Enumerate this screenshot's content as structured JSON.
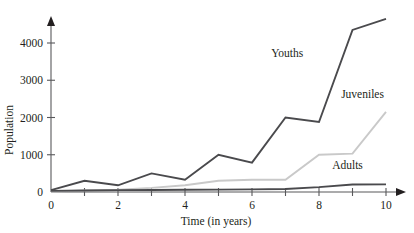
{
  "chart_data": {
    "type": "line",
    "title": "",
    "xlabel": "Time (in years)",
    "ylabel": "Population",
    "xlim": [
      0,
      10
    ],
    "ylim": [
      0,
      4800
    ],
    "grid": false,
    "legend": "inline-annotations",
    "x": [
      0,
      1,
      2,
      3,
      4,
      5,
      6,
      7,
      8,
      9,
      10
    ],
    "xticks": [
      0,
      2,
      4,
      6,
      8,
      10
    ],
    "xtick_labels": [
      "0",
      "2",
      "4",
      "6",
      "8",
      "10"
    ],
    "xminor_ticks": [
      1,
      3,
      5,
      7,
      9
    ],
    "yticks": [
      0,
      1000,
      2000,
      3000,
      4000
    ],
    "ytick_labels": [
      "0",
      "1000",
      "2000",
      "3000",
      "4000"
    ],
    "series": [
      {
        "name": "Youths",
        "color": "#4a4a4d",
        "width": 1.9,
        "values": [
          50,
          300,
          180,
          500,
          330,
          1000,
          790,
          2000,
          1880,
          4350,
          4650
        ],
        "label_x": 7.05,
        "label_y": 3620
      },
      {
        "name": "Juveniles",
        "color": "#c9c9c9",
        "width": 1.9,
        "values": [
          10,
          40,
          60,
          110,
          180,
          300,
          330,
          330,
          1000,
          1030,
          2150
        ],
        "label_x": 9.3,
        "label_y": 2520
      },
      {
        "name": "Adults",
        "color": "#4a4a4d",
        "width": 1.9,
        "values": [
          30,
          40,
          50,
          55,
          60,
          65,
          70,
          80,
          130,
          200,
          205
        ],
        "label_x": 8.85,
        "label_y": 620
      }
    ]
  },
  "axes": {
    "y_axis_name": "y-axis",
    "x_axis_name": "x-axis"
  }
}
